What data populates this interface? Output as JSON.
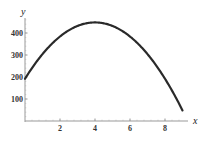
{
  "chart_data": {
    "type": "line",
    "title": "",
    "xlabel": "x",
    "ylabel": "y",
    "xlim": [
      0,
      9.5
    ],
    "ylim": [
      0,
      470
    ],
    "grid": false,
    "x_ticks": [
      2,
      4,
      6,
      8
    ],
    "y_ticks": [
      100,
      200,
      300,
      400
    ],
    "x_tick_labels": [
      "2",
      "4",
      "6",
      "8"
    ],
    "y_tick_labels": [
      "100",
      "200",
      "300",
      "400"
    ],
    "function": "y = -16x^2 + 128x + 192",
    "series": [
      {
        "name": "curve",
        "color": "#2a2a2a",
        "x": [
          0,
          1,
          2,
          3,
          4,
          5,
          6,
          7,
          8,
          9
        ],
        "values": [
          192,
          304,
          384,
          432,
          448,
          432,
          384,
          304,
          192,
          48
        ]
      }
    ]
  }
}
